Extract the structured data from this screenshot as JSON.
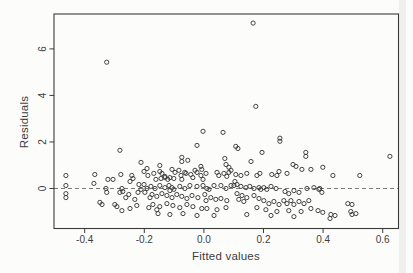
{
  "figure": {
    "background": "#fcfcfb",
    "frame_color": "#3b3b3b",
    "point_color": "#3b3b3b",
    "text_color": "#3d3d3d",
    "dashed_line_color": "#6a6a6a"
  },
  "chart_data": {
    "type": "scatter",
    "title": "",
    "xlabel": "Fitted values",
    "ylabel": "Residuals",
    "xlim": [
      -0.503,
      0.653
    ],
    "ylim": [
      -1.72,
      7.5
    ],
    "x_ticks": [
      -0.4,
      -0.2,
      0.0,
      0.2,
      0.4,
      0.6
    ],
    "x_tick_labels": [
      "-0.4",
      "-0.2",
      "0.0",
      "0.2",
      "0.4",
      "0.6"
    ],
    "y_ticks": [
      0,
      2,
      4,
      6
    ],
    "y_tick_labels": [
      "0",
      "2",
      "4",
      "6"
    ],
    "grid": false,
    "legend": null,
    "marker": "open-circle",
    "reference_line": {
      "type": "horizontal",
      "style": "dashed",
      "y": 0
    },
    "points": [
      [
        0.165,
        7.11
      ],
      [
        -0.326,
        5.43
      ],
      [
        0.174,
        3.53
      ],
      [
        -0.003,
        2.46
      ],
      [
        0.064,
        2.41
      ],
      [
        0.255,
        2.16
      ],
      [
        0.255,
        2.03
      ],
      [
        -0.282,
        1.64
      ],
      [
        -0.211,
        1.12
      ],
      [
        0.107,
        1.81
      ],
      [
        0.114,
        1.72
      ],
      [
        0.195,
        1.55
      ],
      [
        0.342,
        1.55
      ],
      [
        0.342,
        1.38
      ],
      [
        0.158,
        1.16
      ],
      [
        0.299,
        1.03
      ],
      [
        0.309,
        0.95
      ],
      [
        0.329,
        0.82
      ],
      [
        0.359,
        0.82
      ],
      [
        0.252,
        0.73
      ],
      [
        0.279,
        0.65
      ],
      [
        0.228,
        0.6
      ],
      [
        0.624,
        1.38
      ],
      [
        0.399,
        0.91
      ],
      [
        -0.023,
        1.85
      ],
      [
        -0.074,
        1.34
      ],
      [
        -0.074,
        1.16
      ],
      [
        -0.054,
        1.21
      ],
      [
        0.07,
        1.29
      ],
      [
        0.074,
        1.03
      ],
      [
        0.084,
        0.91
      ],
      [
        0.091,
        0.78
      ],
      [
        0.084,
        0.69
      ],
      [
        -0.191,
        0.86
      ],
      [
        -0.148,
        0.99
      ],
      [
        -0.201,
        0.73
      ],
      [
        -0.148,
        0.73
      ],
      [
        -0.107,
        0.82
      ],
      [
        -0.084,
        0.78
      ],
      [
        -0.064,
        0.69
      ],
      [
        -0.044,
        0.6
      ],
      [
        -0.03,
        0.78
      ],
      [
        -0.023,
        0.69
      ],
      [
        -0.01,
        0.95
      ],
      [
        -0.007,
        0.82
      ],
      [
        -0.463,
        0.56
      ],
      [
        -0.463,
        0.13
      ],
      [
        -0.463,
        -0.22
      ],
      [
        -0.463,
        -0.39
      ],
      [
        -0.366,
        0.6
      ],
      [
        -0.369,
        0.22
      ],
      [
        -0.322,
        0.39
      ],
      [
        -0.305,
        0.39
      ],
      [
        -0.279,
        0.6
      ],
      [
        -0.242,
        0.56
      ],
      [
        -0.238,
        0.43
      ],
      [
        -0.329,
        0.0
      ],
      [
        -0.326,
        -0.17
      ],
      [
        -0.349,
        -0.6
      ],
      [
        -0.342,
        -0.69
      ],
      [
        -0.282,
        -0.17
      ],
      [
        -0.275,
        0.0
      ],
      [
        -0.272,
        -0.13
      ],
      [
        -0.252,
        -0.26
      ],
      [
        -0.262,
        -0.39
      ],
      [
        -0.232,
        -0.47
      ],
      [
        -0.221,
        -0.17
      ],
      [
        -0.211,
        -0.04
      ],
      [
        -0.218,
        0.17
      ],
      [
        -0.248,
        0.3
      ],
      [
        -0.225,
        -0.73
      ],
      [
        -0.248,
        -0.86
      ],
      [
        -0.275,
        -0.95
      ],
      [
        -0.299,
        -0.69
      ],
      [
        -0.292,
        -0.78
      ],
      [
        -0.161,
        0.39
      ],
      [
        -0.144,
        0.43
      ],
      [
        -0.131,
        0.47
      ],
      [
        -0.121,
        0.39
      ],
      [
        -0.114,
        0.47
      ],
      [
        -0.101,
        0.43
      ],
      [
        -0.074,
        0.39
      ],
      [
        -0.037,
        0.47
      ],
      [
        -0.003,
        0.39
      ],
      [
        -0.178,
        0.09
      ],
      [
        -0.164,
        0.0
      ],
      [
        -0.148,
        0.13
      ],
      [
        -0.131,
        0.04
      ],
      [
        -0.117,
        0.13
      ],
      [
        -0.107,
        0.04
      ],
      [
        -0.101,
        -0.04
      ],
      [
        -0.114,
        -0.09
      ],
      [
        -0.081,
        0.09
      ],
      [
        -0.064,
        0.0
      ],
      [
        -0.047,
        0.13
      ],
      [
        -0.023,
        0.09
      ],
      [
        -0.003,
        0.13
      ],
      [
        0.01,
        0.0
      ],
      [
        -0.174,
        -0.26
      ],
      [
        -0.158,
        -0.34
      ],
      [
        -0.141,
        -0.22
      ],
      [
        -0.124,
        -0.3
      ],
      [
        -0.107,
        -0.39
      ],
      [
        -0.091,
        -0.26
      ],
      [
        -0.074,
        -0.34
      ],
      [
        -0.057,
        -0.43
      ],
      [
        -0.04,
        -0.3
      ],
      [
        -0.02,
        -0.39
      ],
      [
        0.003,
        -0.26
      ],
      [
        -0.171,
        -0.69
      ],
      [
        -0.148,
        -0.78
      ],
      [
        -0.124,
        -0.65
      ],
      [
        -0.104,
        -0.73
      ],
      [
        -0.081,
        -0.82
      ],
      [
        -0.057,
        -0.69
      ],
      [
        -0.037,
        -0.78
      ],
      [
        -0.007,
        -0.86
      ],
      [
        -0.154,
        -1.08
      ],
      [
        -0.114,
        -1.12
      ],
      [
        -0.07,
        -1.08
      ],
      [
        -0.023,
        -1.16
      ],
      [
        0.007,
        0.65
      ],
      [
        0.044,
        0.69
      ],
      [
        0.05,
        0.56
      ],
      [
        0.067,
        0.65
      ],
      [
        0.077,
        0.52
      ],
      [
        -0.201,
        0.17
      ],
      [
        -0.191,
        0.0
      ],
      [
        -0.198,
        -0.17
      ],
      [
        0.017,
        -0.04
      ],
      [
        0.034,
        0.13
      ],
      [
        0.057,
        0.13
      ],
      [
        0.074,
        0.0
      ],
      [
        0.091,
        0.13
      ],
      [
        -0.181,
        -0.39
      ],
      [
        0.023,
        -0.39
      ],
      [
        0.04,
        -0.47
      ],
      [
        0.057,
        -0.43
      ],
      [
        0.077,
        -0.52
      ],
      [
        -0.185,
        -0.82
      ],
      [
        -0.158,
        -0.91
      ],
      [
        0.007,
        -0.52
      ],
      [
        0.044,
        -0.91
      ],
      [
        0.074,
        -0.82
      ],
      [
        0.034,
        -1.16
      ],
      [
        0.01,
        -0.86
      ],
      [
        -0.188,
        0.56
      ],
      [
        -0.168,
        0.65
      ],
      [
        -0.141,
        0.65
      ],
      [
        -0.131,
        0.52
      ],
      [
        -0.097,
        0.69
      ],
      [
        -0.077,
        0.56
      ],
      [
        -0.06,
        0.65
      ],
      [
        -0.01,
        0.56
      ],
      [
        0.107,
        0.6
      ],
      [
        0.124,
        0.56
      ],
      [
        0.144,
        0.65
      ],
      [
        0.178,
        0.56
      ],
      [
        0.188,
        0.65
      ],
      [
        0.245,
        0.56
      ],
      [
        0.104,
        0.3
      ],
      [
        0.101,
        0.13
      ],
      [
        0.111,
        0.17
      ],
      [
        0.124,
        0.09
      ],
      [
        0.141,
        0.04
      ],
      [
        0.154,
        0.09
      ],
      [
        0.168,
        0.0
      ],
      [
        0.185,
        0.04
      ],
      [
        0.191,
        -0.04
      ],
      [
        0.201,
        0.04
      ],
      [
        0.211,
        -0.04
      ],
      [
        0.225,
        0.09
      ],
      [
        0.242,
        0.0
      ],
      [
        0.272,
        -0.13
      ],
      [
        0.285,
        -0.22
      ],
      [
        0.302,
        -0.09
      ],
      [
        0.319,
        -0.17
      ],
      [
        0.346,
        0.0
      ],
      [
        0.369,
        0.04
      ],
      [
        0.386,
        -0.04
      ],
      [
        0.111,
        -0.22
      ],
      [
        0.128,
        -0.3
      ],
      [
        0.144,
        -0.39
      ],
      [
        0.117,
        -0.47
      ],
      [
        0.134,
        -0.56
      ],
      [
        0.168,
        -0.3
      ],
      [
        0.185,
        -0.43
      ],
      [
        0.201,
        -0.52
      ],
      [
        0.218,
        -0.65
      ],
      [
        0.235,
        -0.56
      ],
      [
        0.252,
        -0.69
      ],
      [
        0.268,
        -0.52
      ],
      [
        0.279,
        -0.65
      ],
      [
        0.292,
        -0.52
      ],
      [
        0.302,
        -0.69
      ],
      [
        0.319,
        -0.56
      ],
      [
        0.336,
        -0.65
      ],
      [
        0.352,
        -0.52
      ],
      [
        0.178,
        -0.82
      ],
      [
        0.208,
        -0.91
      ],
      [
        0.245,
        -0.99
      ],
      [
        0.285,
        -0.95
      ],
      [
        0.326,
        -0.99
      ],
      [
        0.359,
        -0.86
      ],
      [
        0.383,
        -0.95
      ],
      [
        0.144,
        -1.12
      ],
      [
        0.225,
        -1.16
      ],
      [
        0.302,
        -1.21
      ],
      [
        0.433,
        0.56
      ],
      [
        0.523,
        0.56
      ],
      [
        0.389,
        0.0
      ],
      [
        0.396,
        -0.17
      ],
      [
        0.483,
        -0.65
      ],
      [
        0.497,
        -0.69
      ],
      [
        0.399,
        -1.03
      ],
      [
        0.426,
        -1.12
      ],
      [
        0.44,
        -1.16
      ],
      [
        0.423,
        -1.29
      ],
      [
        0.493,
        -0.99
      ],
      [
        0.497,
        -1.12
      ],
      [
        0.51,
        -1.08
      ]
    ]
  }
}
